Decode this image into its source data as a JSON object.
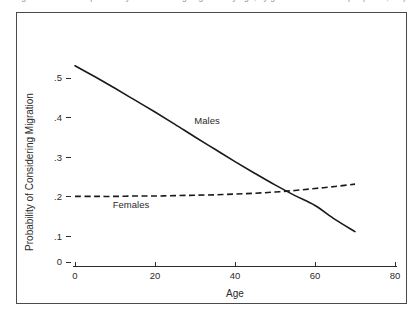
{
  "caption": {
    "text": "Figure 1. Predicted probability of considering migration by age, by gender. Ghana Sample (N = 1,284)."
  },
  "chart_data": {
    "type": "line",
    "title": "",
    "xlabel": "Age",
    "ylabel": "Probability of Considering Migration",
    "xlim": [
      0,
      80
    ],
    "ylim": [
      0,
      0.55
    ],
    "xticks": [
      0,
      20,
      40,
      60,
      80
    ],
    "xticklabels": [
      "0",
      "20",
      "40",
      "60",
      "80"
    ],
    "yticks": [
      0,
      0.1,
      0.2,
      0.3,
      0.4,
      0.5
    ],
    "yticklabels": [
      "0",
      ".1",
      ".2",
      ".3",
      ".4",
      ".5"
    ],
    "grid": false,
    "legend_position": "inline-annotation",
    "y_axis_break_between": [
      "0",
      ".1"
    ],
    "series": [
      {
        "name": "Males",
        "style": "solid",
        "label_x": 33,
        "label_y": 0.385,
        "x": [
          0,
          5,
          10,
          15,
          20,
          25,
          30,
          35,
          40,
          45,
          50,
          55,
          60,
          65,
          70
        ],
        "values": [
          0.531,
          0.503,
          0.474,
          0.444,
          0.414,
          0.383,
          0.351,
          0.32,
          0.289,
          0.259,
          0.23,
          0.203,
          0.178,
          0.143,
          0.112
        ]
      },
      {
        "name": "Females",
        "style": "dashed",
        "label_x": 14,
        "label_y": 0.172,
        "x": [
          0,
          5,
          10,
          15,
          20,
          25,
          30,
          35,
          40,
          45,
          50,
          55,
          60,
          65,
          70
        ],
        "values": [
          0.201,
          0.201,
          0.201,
          0.202,
          0.202,
          0.203,
          0.204,
          0.205,
          0.207,
          0.209,
          0.212,
          0.216,
          0.221,
          0.226,
          0.232
        ]
      }
    ],
    "annotations": [
      {
        "text": "Males",
        "x": 33,
        "y": 0.385
      },
      {
        "text": "Females",
        "x": 14,
        "y": 0.172
      }
    ]
  }
}
